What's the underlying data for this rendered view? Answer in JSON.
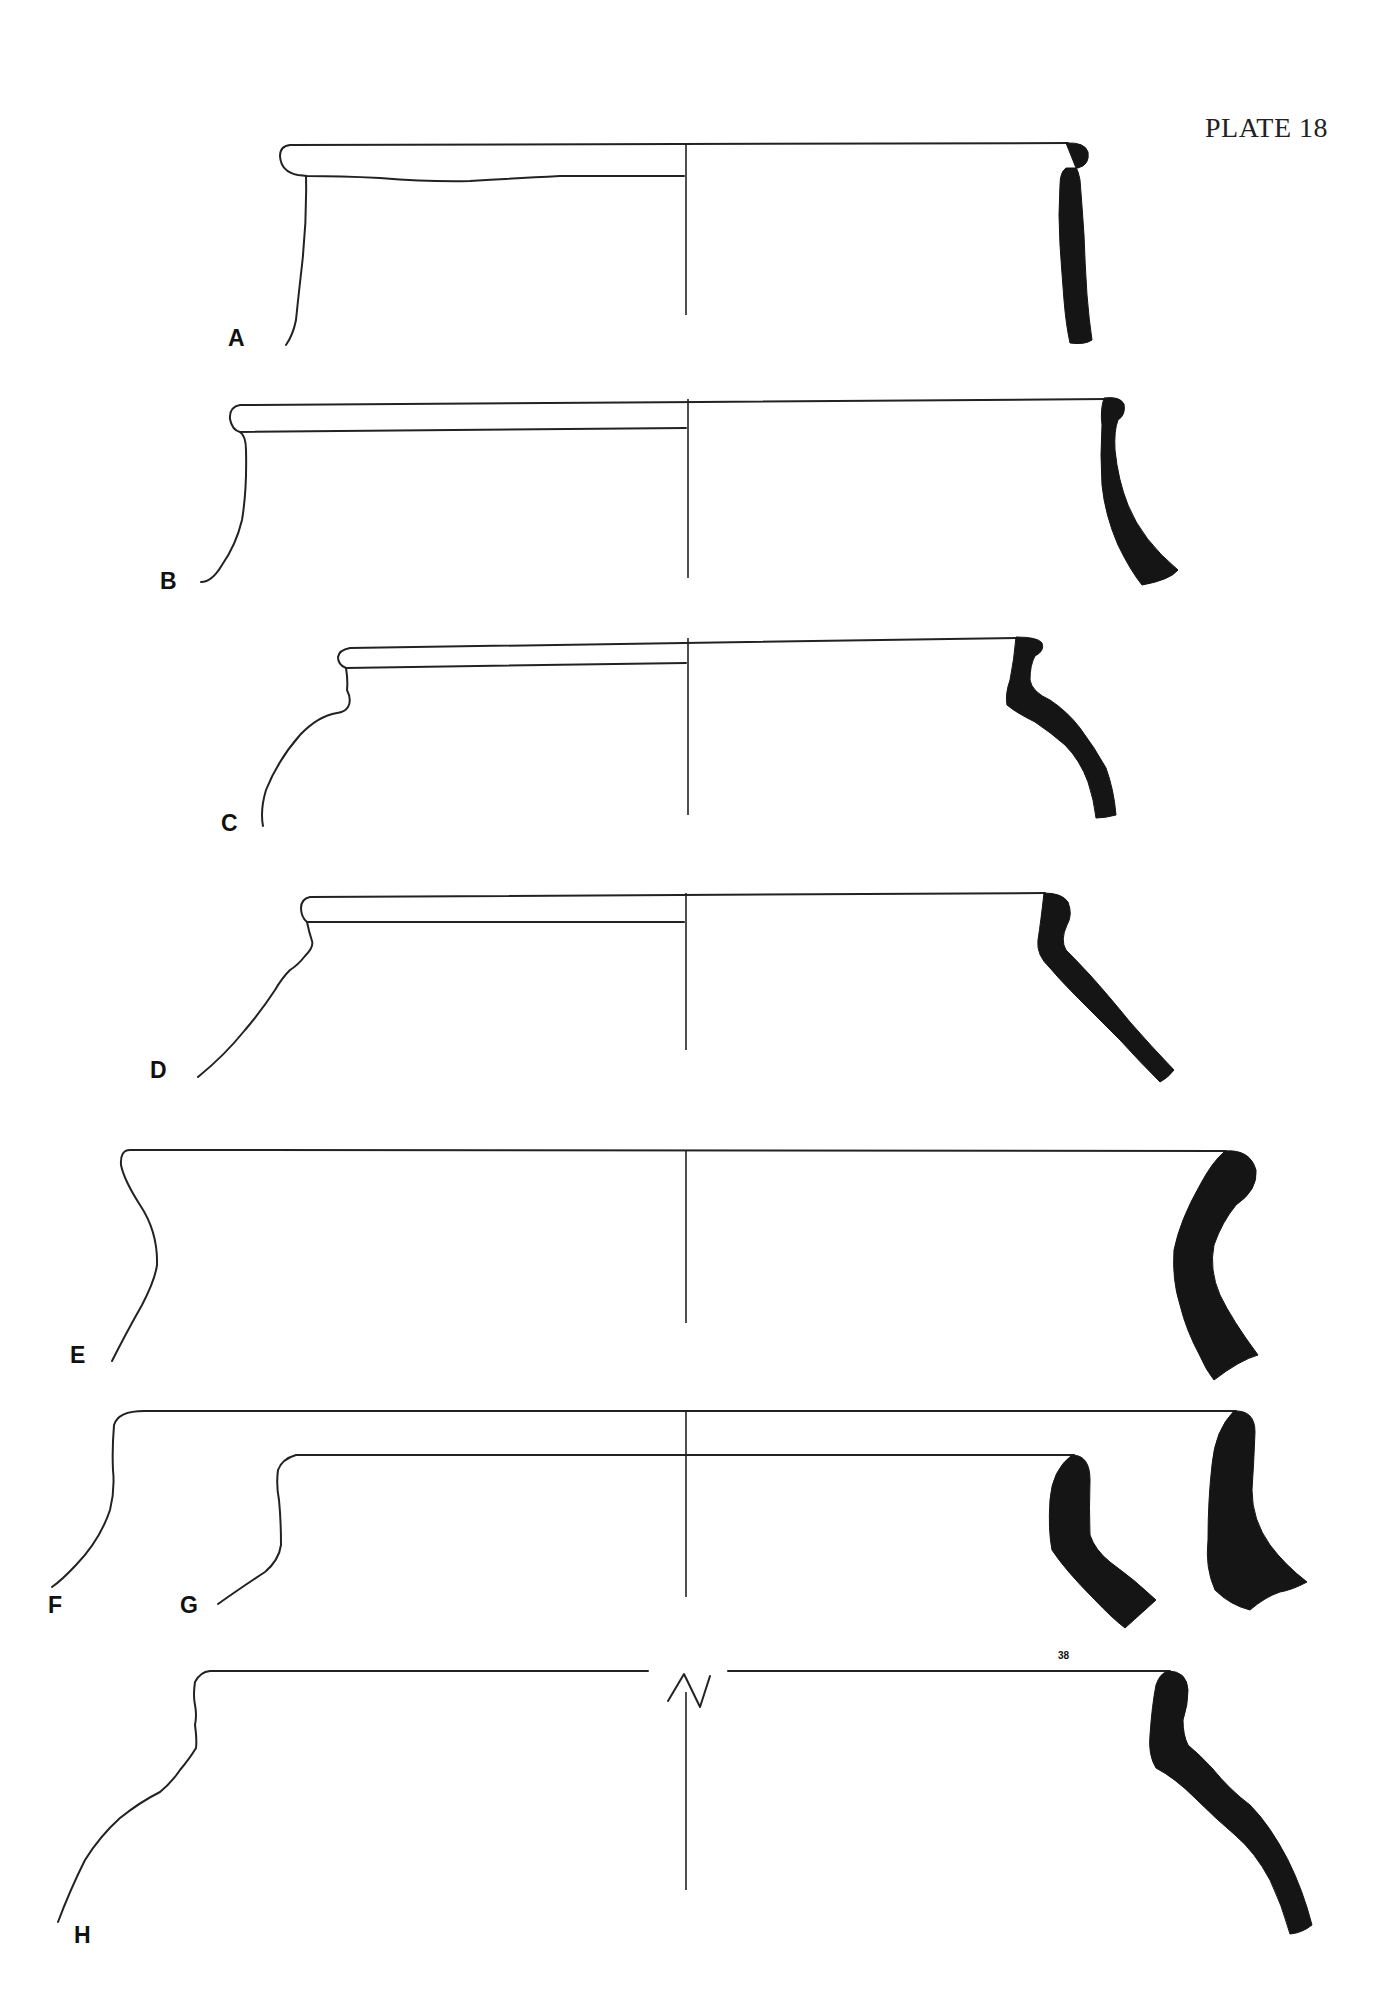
{
  "page": {
    "title": "PLATE 18",
    "page_number": "38",
    "background": "#ffffff",
    "ink_color": "#151515"
  },
  "figures": [
    {
      "id": "A",
      "label": "A",
      "type": "vessel-rim-profile"
    },
    {
      "id": "B",
      "label": "B",
      "type": "vessel-rim-profile"
    },
    {
      "id": "C",
      "label": "C",
      "type": "vessel-rim-profile"
    },
    {
      "id": "D",
      "label": "D",
      "type": "vessel-rim-profile"
    },
    {
      "id": "E",
      "label": "E",
      "type": "vessel-rim-profile"
    },
    {
      "id": "F",
      "label": "F",
      "type": "vessel-rim-profile"
    },
    {
      "id": "G",
      "label": "G",
      "type": "vessel-rim-profile"
    },
    {
      "id": "H",
      "label": "H",
      "type": "vessel-rim-profile",
      "note": "axis break symbol on rim line"
    }
  ]
}
